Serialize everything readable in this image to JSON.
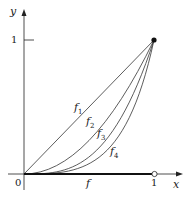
{
  "diagram": {
    "axes": {
      "x_label": "x",
      "y_label": "y",
      "origin_label": "0",
      "x_tick_label": "1",
      "y_tick_label": "1"
    },
    "curves": [
      {
        "name": "f",
        "sub": "1",
        "exponent": 1
      },
      {
        "name": "f",
        "sub": "2",
        "exponent": 2
      },
      {
        "name": "f",
        "sub": "3",
        "exponent": 3
      },
      {
        "name": "f",
        "sub": "4",
        "exponent": 4
      }
    ],
    "limit_label": "f",
    "endpoint_closed": "(1,1)",
    "endpoint_open": "(1,0)"
  }
}
